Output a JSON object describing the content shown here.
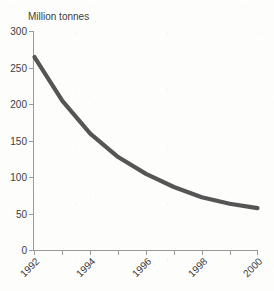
{
  "chart_data": {
    "type": "line",
    "title": "Million tonnes",
    "xlabel": "",
    "ylabel": "Million tonnes",
    "x": [
      1992,
      1993,
      1994,
      1995,
      1996,
      1997,
      1998,
      1999,
      2000
    ],
    "values": [
      265,
      205,
      160,
      128,
      105,
      87,
      73,
      64,
      58
    ],
    "series": [
      {
        "name": "Million tonnes",
        "values": [
          265,
          205,
          160,
          128,
          105,
          87,
          73,
          64,
          58
        ]
      }
    ],
    "xlim": [
      1992,
      2000
    ],
    "ylim": [
      0,
      300
    ],
    "ytick_labels": [
      "300",
      "250",
      "200",
      "150",
      "100",
      "50",
      "0"
    ],
    "ytick_values": [
      300,
      250,
      200,
      150,
      100,
      50,
      0
    ],
    "xtick_labels": [
      "1992",
      "1994",
      "1996",
      "1998",
      "2000"
    ],
    "xtick_values": [
      1992,
      1994,
      1996,
      1998,
      2000
    ],
    "xtick_minor_values": [
      1993,
      1995,
      1997,
      1999
    ],
    "xtick_label_rotation": "-45",
    "grid": false,
    "legend": false,
    "line_color": "#555555",
    "axis_color": "#9a9a9a",
    "text_color": "#3c3c3c",
    "background_color": "#fdfdfc"
  }
}
